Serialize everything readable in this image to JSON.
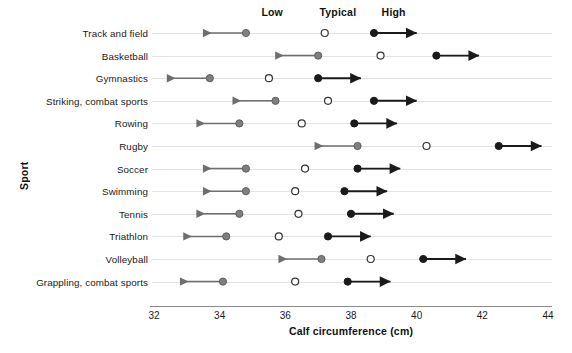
{
  "chart_data": {
    "type": "scatter",
    "title": "",
    "xlabel": "Calf circumference (cm)",
    "ylabel": "Sport",
    "xlim": [
      32,
      44
    ],
    "xticks": [
      32,
      34,
      36,
      38,
      40,
      42,
      44
    ],
    "xtick_labels": [
      "32",
      "34",
      "36",
      "38",
      "40",
      "42",
      "44"
    ],
    "grid": "horizontal-row-lines",
    "legend_position": "top",
    "legend": [
      {
        "key": "low",
        "label": "Low",
        "marker": "filled-gray-circle",
        "color": "#808080",
        "arrow": "left",
        "x_at": 35.6
      },
      {
        "key": "typical",
        "label": "Typical",
        "marker": "hollow-circle",
        "color": "#ffffff",
        "arrow": "none",
        "x_at": 37.6
      },
      {
        "key": "high",
        "label": "High",
        "marker": "filled-black-circle",
        "color": "#1a1a1a",
        "arrow": "right",
        "x_at": 39.3
      }
    ],
    "categories": [
      "Track and field",
      "Basketball",
      "Gymnastics",
      "Striking, combat sports",
      "Rowing",
      "Rugby",
      "Soccer",
      "Swimming",
      "Tennis",
      "Triathlon",
      "Volleyball",
      "Grappling, combat sports"
    ],
    "series": [
      {
        "name": "Low",
        "values": [
          34.8,
          37.0,
          33.7,
          35.7,
          34.6,
          38.2,
          34.8,
          34.8,
          34.6,
          34.2,
          37.1,
          34.1
        ]
      },
      {
        "name": "Typical",
        "values": [
          37.2,
          38.9,
          35.5,
          37.3,
          36.5,
          40.3,
          36.6,
          36.3,
          36.4,
          35.8,
          38.6,
          36.3
        ]
      },
      {
        "name": "High",
        "values": [
          38.7,
          40.6,
          37.0,
          38.7,
          38.1,
          42.5,
          38.2,
          37.8,
          38.0,
          37.3,
          40.2,
          37.9
        ]
      }
    ],
    "arrow_ends": {
      "low_arrow_span": 1.3,
      "high_arrow_span": 1.3,
      "note": "Low markers have a leftward arrow; High markers have a rightward arrow; Typical is a hollow circle with no arrow."
    },
    "colors": {
      "low_marker": "#7f7f7f",
      "typical_marker_fill": "#ffffff",
      "typical_marker_stroke": "#333333",
      "high_marker": "#1a1a1a",
      "low_arrow": "#6e6e6e",
      "high_arrow": "#1a1a1a",
      "row_line": "#e3e3e3",
      "axis": "#8a8a8a",
      "text": "#1a1a1a"
    }
  }
}
